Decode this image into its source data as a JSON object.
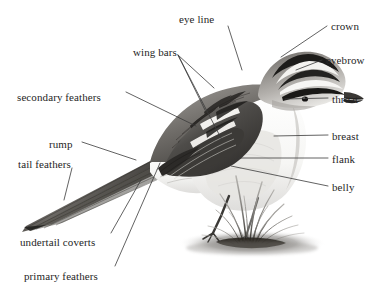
{
  "diagram": {
    "background_color": "#ffffff",
    "ink_color": "#262626",
    "line_color": "#3a3a3a",
    "width": 387,
    "height": 298
  },
  "labels": [
    {
      "id": "eye-line",
      "text": "eye line",
      "x": 179,
      "y": 14,
      "align": "left"
    },
    {
      "id": "crown",
      "text": "crown",
      "x": 331,
      "y": 21,
      "align": "left"
    },
    {
      "id": "wing-bars",
      "text": "wing bars",
      "x": 133,
      "y": 47,
      "align": "left"
    },
    {
      "id": "eyebrow",
      "text": "eyebrow",
      "x": 326,
      "y": 55,
      "align": "left"
    },
    {
      "id": "secondary-feathers",
      "text": "secondary feathers",
      "x": 17,
      "y": 92,
      "align": "left"
    },
    {
      "id": "throat",
      "text": "throat",
      "x": 332,
      "y": 94,
      "align": "left"
    },
    {
      "id": "breast",
      "text": "breast",
      "x": 332,
      "y": 131,
      "align": "left"
    },
    {
      "id": "rump",
      "text": "rump",
      "x": 49,
      "y": 139,
      "align": "left"
    },
    {
      "id": "flank",
      "text": "flank",
      "x": 332,
      "y": 154,
      "align": "left"
    },
    {
      "id": "tail-feathers",
      "text": "tail feathers",
      "x": 18,
      "y": 159,
      "align": "left"
    },
    {
      "id": "belly",
      "text": "belly",
      "x": 332,
      "y": 182,
      "align": "left"
    },
    {
      "id": "undertail-coverts",
      "text": "undertail coverts",
      "x": 20,
      "y": 237,
      "align": "left"
    },
    {
      "id": "primary-feathers",
      "text": "primary feathers",
      "x": 24,
      "y": 271,
      "align": "left"
    }
  ],
  "leaders": [
    {
      "id": "eye-line-leader",
      "for": "eye line",
      "points": "228,26 242,70"
    },
    {
      "id": "crown-leader",
      "for": "crown",
      "points": "327,26 281,57"
    },
    {
      "id": "wing-bars-leader-1",
      "for": "wing bars",
      "points": "178,55 205,110"
    },
    {
      "id": "wing-bars-leader-2",
      "for": "wing bars",
      "points": "178,55 214,88"
    },
    {
      "id": "wing-bars-leader-3",
      "for": "wing bars",
      "points": "178,55 222,140"
    },
    {
      "id": "eyebrow-leader",
      "for": "eyebrow",
      "points": "322,60 296,70"
    },
    {
      "id": "secondary-feathers-leader",
      "for": "secondary feathers",
      "points": "126,92 196,126"
    },
    {
      "id": "throat-leader",
      "for": "throat",
      "points": "328,98 285,99"
    },
    {
      "id": "breast-leader",
      "for": "breast",
      "points": "328,135 274,136"
    },
    {
      "id": "rump-leader",
      "for": "rump",
      "points": "82,142 136,160"
    },
    {
      "id": "flank-leader",
      "for": "flank",
      "points": "328,158 238,158"
    },
    {
      "id": "tail-feathers-leader",
      "for": "tail feathers",
      "points": "72,168 64,200"
    },
    {
      "id": "belly-leader",
      "for": "belly",
      "points": "328,186 231,166"
    },
    {
      "id": "undertail-coverts-leader",
      "for": "undertail coverts",
      "points": "111,233 141,180"
    },
    {
      "id": "primary-feathers-leader",
      "for": "primary feathers",
      "points": "115,266 160,163"
    }
  ],
  "chart_data": {
    "type": "diagram",
    "annotations": [
      "eye line",
      "crown",
      "wing bars",
      "eyebrow",
      "secondary feathers",
      "throat",
      "breast",
      "rump",
      "flank",
      "tail feathers",
      "belly",
      "undertail coverts",
      "primary feathers"
    ]
  }
}
